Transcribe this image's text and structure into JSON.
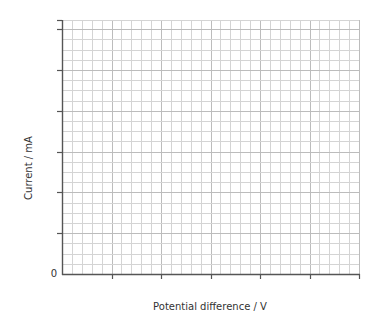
{
  "chart_data": {
    "type": "line",
    "title": "",
    "xlabel": "Potential difference / V",
    "ylabel": "Current / mA",
    "origin_label": "0",
    "x_ticks": 6,
    "y_ticks": 6,
    "x_tick_labels": [],
    "y_tick_labels": [],
    "series": [],
    "grid": true,
    "minor_per_major_x": 5,
    "minor_per_major_y": 4,
    "colors": {
      "axis": "#555555",
      "grid_minor": "#d4d4d4",
      "grid_major": "#bcbcbc",
      "text": "#333333"
    }
  }
}
